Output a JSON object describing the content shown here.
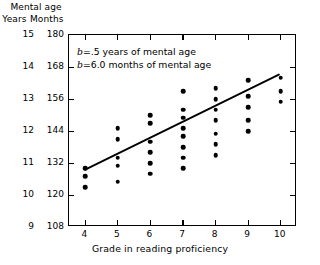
{
  "chart_data": {
    "type": "scatter",
    "title": "",
    "xlabel": "Grade in reading proficiency",
    "ylabel": "Mental age",
    "y_axis_header": "Mental age",
    "y_axis_sub_left": "Years",
    "y_axis_sub_right": "Months",
    "xlim": [
      3.5,
      10.5
    ],
    "ylim_months": [
      108,
      180
    ],
    "grid": false,
    "legend": "none",
    "x_ticks": [
      4,
      5,
      6,
      7,
      8,
      9,
      10
    ],
    "y_ticks_months": [
      108,
      120,
      132,
      144,
      156,
      168,
      180
    ],
    "y_ticks_years": [
      9,
      10,
      11,
      12,
      13,
      14,
      15
    ],
    "annotations": [
      {
        "prefix": "b",
        "text": "=.5 years of mental age"
      },
      {
        "prefix": "b",
        "text": "=6.0 months of mental age"
      }
    ],
    "series": [
      {
        "name": "observations",
        "marker": "filled-circle",
        "color": "#000000",
        "points": [
          {
            "x": 4,
            "y": 123
          },
          {
            "x": 4,
            "y": 127
          },
          {
            "x": 4,
            "y": 130
          },
          {
            "x": 5,
            "y": 125
          },
          {
            "x": 5,
            "y": 131
          },
          {
            "x": 5,
            "y": 134
          },
          {
            "x": 5,
            "y": 141
          },
          {
            "x": 5,
            "y": 145
          },
          {
            "x": 6,
            "y": 128
          },
          {
            "x": 6,
            "y": 132
          },
          {
            "x": 6,
            "y": 136
          },
          {
            "x": 6,
            "y": 140
          },
          {
            "x": 6,
            "y": 147
          },
          {
            "x": 6,
            "y": 150
          },
          {
            "x": 7,
            "y": 130
          },
          {
            "x": 7,
            "y": 134
          },
          {
            "x": 7,
            "y": 138
          },
          {
            "x": 7,
            "y": 142
          },
          {
            "x": 7,
            "y": 145
          },
          {
            "x": 7,
            "y": 149
          },
          {
            "x": 7,
            "y": 152
          },
          {
            "x": 7,
            "y": 159
          },
          {
            "x": 8,
            "y": 135
          },
          {
            "x": 8,
            "y": 139
          },
          {
            "x": 8,
            "y": 143
          },
          {
            "x": 8,
            "y": 148
          },
          {
            "x": 8,
            "y": 152
          },
          {
            "x": 8,
            "y": 156
          },
          {
            "x": 8,
            "y": 160
          },
          {
            "x": 9,
            "y": 144
          },
          {
            "x": 9,
            "y": 148
          },
          {
            "x": 9,
            "y": 153
          },
          {
            "x": 9,
            "y": 157
          },
          {
            "x": 9,
            "y": 163
          },
          {
            "x": 10,
            "y": 155
          },
          {
            "x": 10,
            "y": 159
          },
          {
            "x": 10,
            "y": 164
          }
        ]
      }
    ],
    "fit_line": {
      "name": "regression line",
      "slope_months_per_grade": 6.0,
      "slope_years_per_grade": 0.5,
      "x_start": 4,
      "y_start": 129,
      "x_end": 10,
      "y_end": 165,
      "color": "#000000"
    }
  }
}
